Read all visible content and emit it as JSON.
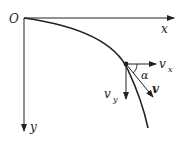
{
  "diagram": {
    "type": "projectile-velocity-decomposition",
    "labels": {
      "origin": "O",
      "x_axis": "x",
      "y_axis": "y",
      "vx": "v",
      "vx_sub": "x",
      "vy": "v",
      "vy_sub": "y",
      "v": "v",
      "angle": "α"
    },
    "colors": {
      "stroke": "#222222",
      "background": "#ffffff"
    }
  }
}
